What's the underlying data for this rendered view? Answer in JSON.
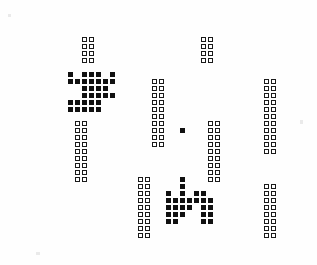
{
  "display": {
    "kind": "cellular-automaton-grid",
    "screen_label": "",
    "background_color": "#fefefe",
    "bezel_color": "#2b2b2b",
    "alive_cell_color": "#111111",
    "outline_cell_color": "#1a1a1a",
    "cell_size_px": 5,
    "cell_pitch_px": 7,
    "grid_origin_x": 54,
    "grid_origin_y": 30,
    "grid_columns": 36,
    "grid_rows": 31,
    "total_cells": 221,
    "alive_cells": 79,
    "outline_cells": 142
  },
  "bezel": {
    "path": "M 22 34 C 26 22, 40 18, 62 16 C 120 11, 210 12, 272 18 C 288 20, 295 26, 296 38 C 299 80, 299 176, 296 218 C 295 232, 288 240, 272 243 C 212 250, 116 251, 56 246 C 34 244, 24 238, 22 224 C 18 176, 18 80, 22 34 Z"
  },
  "clusters": [
    {
      "name": "top-left-block",
      "style": "outline",
      "origin_col": 4,
      "origin_row": 1,
      "pattern": [
        "11",
        "11",
        "11",
        "11"
      ]
    },
    {
      "name": "top-right-block",
      "style": "outline",
      "origin_col": 21,
      "origin_row": 1,
      "pattern": [
        "11",
        "11",
        "11",
        "11"
      ]
    },
    {
      "name": "left-dense-cluster",
      "style": "alive",
      "origin_col": 2,
      "origin_row": 6,
      "pattern": [
        "1011101",
        "1111111",
        "0011110",
        "0011111",
        "1111100",
        "1111100"
      ]
    },
    {
      "name": "left-lower-strip",
      "style": "outline",
      "origin_col": 3,
      "origin_row": 13,
      "pattern": [
        "11",
        "11",
        "11",
        "11",
        "11",
        "11",
        "11",
        "11",
        "11"
      ]
    },
    {
      "name": "center-strip",
      "style": "outline",
      "origin_col": 14,
      "origin_row": 7,
      "pattern": [
        "11",
        "11",
        "11",
        "11",
        "11",
        "11",
        "11",
        "11",
        "11",
        "11"
      ]
    },
    {
      "name": "center-bottom-strip",
      "style": "outline",
      "origin_col": 12,
      "origin_row": 21,
      "pattern": [
        "11",
        "11",
        "11",
        "11",
        "11",
        "11",
        "11",
        "11",
        "11"
      ]
    },
    {
      "name": "isolated-single-cell",
      "style": "alive",
      "origin_col": 18,
      "origin_row": 14,
      "pattern": [
        "1"
      ]
    },
    {
      "name": "right-center-strip",
      "style": "outline",
      "origin_col": 22,
      "origin_row": 13,
      "pattern": [
        "11",
        "11",
        "11",
        "11",
        "11",
        "11",
        "11",
        "11",
        "11"
      ]
    },
    {
      "name": "far-right-strip",
      "style": "outline",
      "origin_col": 30,
      "origin_row": 7,
      "pattern": [
        "11",
        "11",
        "11",
        "11",
        "11",
        "11",
        "11",
        "11",
        "11",
        "11",
        "11"
      ]
    },
    {
      "name": "bottom-right-strip",
      "style": "outline",
      "origin_col": 30,
      "origin_row": 22,
      "pattern": [
        "11",
        "11",
        "11",
        "11",
        "11",
        "11",
        "11",
        "11"
      ]
    },
    {
      "name": "bottom-center-cluster",
      "style": "alive",
      "origin_col": 16,
      "origin_row": 21,
      "pattern": [
        "0010000",
        "0010000",
        "1010110",
        "1111111",
        "1111011",
        "1110011",
        "1100011"
      ]
    }
  ]
}
